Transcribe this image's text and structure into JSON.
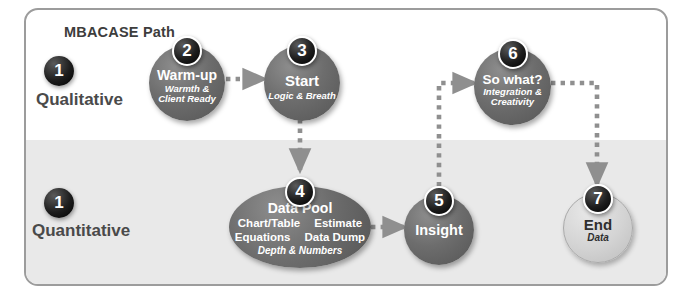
{
  "diagram": {
    "title": "MBACASE Path",
    "phases": [
      {
        "number": "1",
        "label": "Qualitative"
      },
      {
        "number": "1",
        "label": "Quantitative"
      }
    ],
    "nodes": [
      {
        "id": "warm-up",
        "number": "2",
        "title": "Warm-up",
        "sub_line1": "Warmth &",
        "sub_line2": "Client Ready"
      },
      {
        "id": "start",
        "number": "3",
        "title": "Start",
        "sub_line1": "Logic & Breath",
        "sub_line2": ""
      },
      {
        "id": "data-pool",
        "number": "4",
        "title": "Data Pool",
        "items": [
          [
            "Chart/Table",
            "Estimate"
          ],
          [
            "Equations",
            "Data Dump"
          ]
        ],
        "sub_line1": "Depth & Numbers",
        "sub_line2": ""
      },
      {
        "id": "insight",
        "number": "5",
        "title": "Insight",
        "sub_line1": "",
        "sub_line2": ""
      },
      {
        "id": "so-what",
        "number": "6",
        "title": "So what?",
        "sub_line1": "Integration &",
        "sub_line2": "Creativity"
      },
      {
        "id": "end",
        "number": "7",
        "title": "End",
        "sub_line1": "Data",
        "sub_line2": ""
      }
    ],
    "connectors": [
      {
        "from": "warm-up",
        "to": "start",
        "style": "dotted-arrow"
      },
      {
        "from": "start",
        "to": "data-pool",
        "style": "dotted-arrow"
      },
      {
        "from": "data-pool",
        "to": "insight",
        "style": "dotted-arrow"
      },
      {
        "from": "insight",
        "to": "so-what",
        "style": "dotted-arrow"
      },
      {
        "from": "so-what",
        "to": "end",
        "style": "dotted-arrow"
      }
    ],
    "colors": {
      "node_fill": "#6d6d6d",
      "node_fill_light": "#d3d3d3",
      "badge_fill": "#1d1d1d",
      "band_fill": "#e9e9e9",
      "frame_border": "#9c9c9c",
      "connector": "#8f8f8f",
      "title_text": "#3d3d3d"
    }
  }
}
